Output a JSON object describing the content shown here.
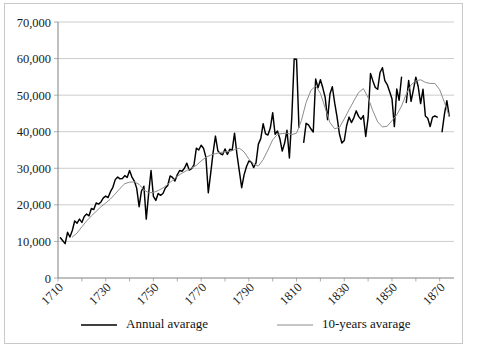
{
  "chart": {
    "title": "",
    "background_color": "#ffffff",
    "frame_color": "#c9c9c9"
  },
  "legend": {
    "position": "bottom",
    "entries": [
      {
        "label": "Annual avarage",
        "color": "#000000",
        "width": 1.45
      },
      {
        "label": "10-years avarage",
        "color": "#8c8c8c",
        "width": 1.0
      }
    ]
  },
  "axes": {
    "y_ticks": [
      "0",
      "10,000",
      "20,000",
      "30,000",
      "40,000",
      "50,000",
      "60,000",
      "70,000"
    ],
    "x_ticks": [
      "1710",
      "1730",
      "1750",
      "1770",
      "1790",
      "1810",
      "1830",
      "1850",
      "1870"
    ]
  },
  "chart_data": {
    "type": "line",
    "title": "",
    "xlabel": "",
    "ylabel": "",
    "xlim": [
      1710,
      1876
    ],
    "ylim": [
      0,
      70000
    ],
    "ytick_values": [
      0,
      10000,
      20000,
      30000,
      40000,
      50000,
      60000,
      70000
    ],
    "xtick_values": [
      1710,
      1730,
      1750,
      1770,
      1790,
      1810,
      1830,
      1850,
      1870
    ],
    "grid": "horizontal",
    "legend_position": "bottom",
    "series": [
      {
        "name": "Annual avarage",
        "color": "#000000",
        "x": [
          1711,
          1712,
          1713,
          1714,
          1715,
          1716,
          1717,
          1718,
          1719,
          1720,
          1721,
          1722,
          1723,
          1724,
          1725,
          1726,
          1727,
          1728,
          1729,
          1730,
          1731,
          1732,
          1733,
          1734,
          1735,
          1736,
          1737,
          1738,
          1739,
          1740,
          1741,
          1742,
          1743,
          1744,
          1745,
          1746,
          1747,
          1748,
          1749,
          1750,
          1751,
          1752,
          1753,
          1754,
          1755,
          1756,
          1757,
          1758,
          1759,
          1760,
          1761,
          1762,
          1763,
          1764,
          1765,
          1766,
          1767,
          1768,
          1769,
          1770,
          1771,
          1772,
          1773,
          1774,
          1775,
          1776,
          1777,
          1778,
          1779,
          1780,
          1781,
          1782,
          1783,
          1784,
          1785,
          1786,
          1787,
          1788,
          1789,
          1790,
          1791,
          1792,
          1793,
          1794,
          1795,
          1796,
          1797,
          1798,
          1799,
          1800,
          1801,
          1802,
          1803,
          1804,
          1805,
          1806,
          1807,
          1808,
          1809,
          1810,
          1811,
          1813,
          1814,
          1815,
          1816,
          1817,
          1818,
          1819,
          1820,
          1821,
          1822,
          1823,
          1824,
          1825,
          1826,
          1827,
          1828,
          1829,
          1830,
          1831,
          1832,
          1833,
          1834,
          1835,
          1836,
          1837,
          1838,
          1839,
          1840,
          1841,
          1842,
          1843,
          1844,
          1845,
          1846,
          1847,
          1848,
          1849,
          1850,
          1851,
          1852,
          1853,
          1854,
          1856,
          1857,
          1858,
          1859,
          1860,
          1861,
          1862,
          1863,
          1864,
          1865,
          1866,
          1867,
          1868,
          1869,
          1871,
          1872,
          1873,
          1874
        ],
        "values": [
          11000,
          10200,
          9400,
          12500,
          11200,
          13000,
          15600,
          15000,
          16100,
          15200,
          16800,
          17500,
          17000,
          19000,
          18700,
          20500,
          20200,
          20800,
          21900,
          22400,
          22000,
          23600,
          24800,
          26900,
          27600,
          27100,
          27200,
          28000,
          27500,
          29400,
          27600,
          26500,
          24500,
          19500,
          23800,
          25100,
          16100,
          23100,
          29400,
          22300,
          21200,
          23100,
          22600,
          23100,
          24600,
          25300,
          27900,
          27500,
          26500,
          28200,
          29400,
          29200,
          30000,
          31400,
          29500,
          29900,
          30900,
          35500,
          35000,
          36300,
          35500,
          33000,
          23300,
          28600,
          34200,
          38800,
          34800,
          34000,
          33700,
          35300,
          33800,
          35200,
          34900,
          39600,
          33900,
          29300,
          24700,
          28200,
          30400,
          32000,
          31700,
          30200,
          31500,
          36600,
          38100,
          42200,
          39400,
          39100,
          41000,
          45200,
          39300,
          40200,
          38100,
          34700,
          36900,
          40400,
          32800,
          43900,
          59900,
          59800,
          41200,
          37100,
          42300,
          41900,
          40800,
          39900,
          54400,
          52000,
          54200,
          52000,
          49400,
          43300,
          50300,
          52300,
          47800,
          43900,
          39300,
          36900,
          37600,
          41700,
          44000,
          42500,
          43800,
          45700,
          44200,
          43400,
          44400,
          38700,
          43900,
          55900,
          53900,
          52100,
          51600,
          56200,
          57500,
          54000,
          52900,
          51000,
          49000,
          41400,
          51700,
          48600,
          54900,
          48000,
          54000,
          48300,
          51500,
          54900,
          52300,
          47700,
          51600,
          44300,
          43700,
          41400,
          44000,
          44300,
          44000,
          40000,
          44800,
          48500,
          44300
        ]
      },
      {
        "name": "10-years avarage",
        "color": "#8c8c8c",
        "x": [
          1716,
          1718,
          1720,
          1722,
          1724,
          1726,
          1728,
          1730,
          1732,
          1734,
          1736,
          1738,
          1740,
          1742,
          1744,
          1746,
          1748,
          1750,
          1752,
          1754,
          1756,
          1758,
          1760,
          1762,
          1764,
          1766,
          1768,
          1770,
          1772,
          1774,
          1776,
          1778,
          1780,
          1782,
          1784,
          1786,
          1788,
          1790,
          1792,
          1794,
          1796,
          1798,
          1800,
          1802,
          1804,
          1806,
          1808,
          1810,
          1812,
          1814,
          1816,
          1818,
          1820,
          1822,
          1824,
          1826,
          1828,
          1830,
          1832,
          1834,
          1836,
          1838,
          1840,
          1842,
          1844,
          1846,
          1848,
          1850,
          1852,
          1854,
          1856,
          1858,
          1860,
          1862,
          1864,
          1866,
          1868,
          1870,
          1872,
          1874
        ],
        "values": [
          11200,
          12300,
          14000,
          15600,
          17000,
          18200,
          19500,
          20500,
          21600,
          23000,
          24500,
          25800,
          26200,
          26300,
          25600,
          24100,
          23300,
          23400,
          23900,
          24600,
          25600,
          26700,
          27800,
          28700,
          29400,
          30100,
          30800,
          32000,
          33000,
          33600,
          34000,
          34300,
          34500,
          34600,
          35100,
          35500,
          34500,
          32500,
          31200,
          30600,
          32400,
          35000,
          37800,
          39300,
          39500,
          39600,
          39200,
          39600,
          43000,
          48000,
          51300,
          52500,
          50500,
          46500,
          42500,
          40800,
          41200,
          43500,
          46000,
          48400,
          50700,
          51800,
          49300,
          45700,
          42700,
          41300,
          41500,
          43000,
          44600,
          47000,
          50300,
          52800,
          53900,
          54200,
          53500,
          53200,
          53200,
          51500,
          48000,
          44200
        ]
      }
    ]
  }
}
